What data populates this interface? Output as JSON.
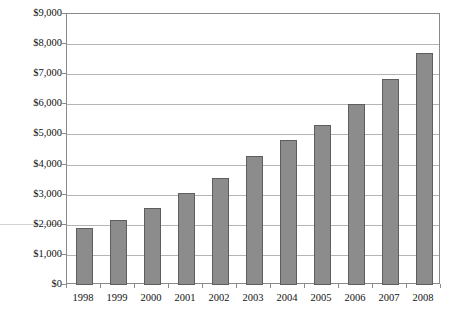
{
  "chart_data": {
    "type": "bar",
    "title": "",
    "subtitle": "",
    "xlabel": "",
    "ylabel": "",
    "categories": [
      "1998",
      "1999",
      "2000",
      "2001",
      "2002",
      "2003",
      "2004",
      "2005",
      "2006",
      "2007",
      "2008"
    ],
    "values": [
      1900,
      2150,
      2550,
      3050,
      3550,
      4300,
      4800,
      5300,
      6000,
      6850,
      7700
    ],
    "ylim": [
      0,
      9000
    ],
    "ytick_labels": [
      "$9,000",
      "$8,000",
      "$7,000",
      "$6,000",
      "$5,000",
      "$4,000",
      "$3,000",
      "$2,000",
      "$1,000",
      "$0"
    ],
    "ytick_values": [
      9000,
      8000,
      7000,
      6000,
      5000,
      4000,
      3000,
      2000,
      1000,
      0
    ],
    "ytick_step": 1000,
    "grid": true,
    "legend": "none",
    "legend_position": "none",
    "bar_color": "#8c8c8c",
    "bar_border_color": "#5e5e5e",
    "grid_color": "#b4b4b4",
    "axis_color": "#8a8a8a",
    "text_color": "#111111"
  }
}
